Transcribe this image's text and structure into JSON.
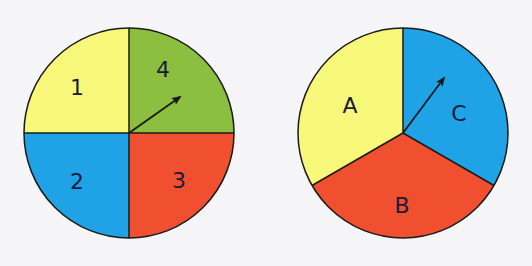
{
  "colors": {
    "yellow": "#f7f77a",
    "green": "#8cbf3f",
    "blue": "#1fa3e6",
    "red": "#f0502f",
    "outline": "#1a1a1a",
    "background": "#f5f5f7"
  },
  "spinners": [
    {
      "name": "spinner-numbers",
      "sectors": [
        {
          "label": "1",
          "color": "yellow",
          "fraction": "1/4"
        },
        {
          "label": "4",
          "color": "green",
          "fraction": "1/4"
        },
        {
          "label": "3",
          "color": "red",
          "fraction": "1/4"
        },
        {
          "label": "2",
          "color": "blue",
          "fraction": "1/4"
        }
      ],
      "pointer_in": "4"
    },
    {
      "name": "spinner-letters",
      "sectors": [
        {
          "label": "A",
          "color": "yellow",
          "fraction": "1/3"
        },
        {
          "label": "C",
          "color": "blue",
          "fraction": "1/3"
        },
        {
          "label": "B",
          "color": "red",
          "fraction": "1/3"
        }
      ],
      "pointer_in": "C"
    }
  ]
}
